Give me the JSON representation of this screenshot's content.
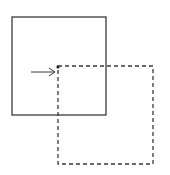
{
  "diagram": {
    "colors": {
      "background": "#ffffff",
      "stroke": "#3a3a3a"
    },
    "shapes": {
      "original_square": {
        "x": 12,
        "y": 17,
        "width": 94,
        "height": 98,
        "style": "solid"
      },
      "translated_square": {
        "x": 58,
        "y": 66,
        "width": 95,
        "height": 98,
        "style": "dashed"
      },
      "arrow": {
        "x1": 31,
        "y1": 72,
        "x2": 55,
        "y2": 72,
        "direction": "right"
      },
      "corner_dot": {
        "cx": 58,
        "cy": 67
      }
    }
  }
}
